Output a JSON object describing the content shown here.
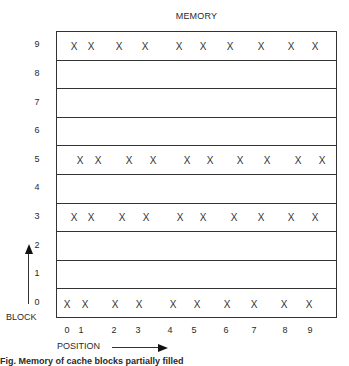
{
  "title": "MEMORY",
  "axis": {
    "block_label": "BLOCK",
    "position_label": "POSITION"
  },
  "caption": "Fig. Memory of cache blocks partially filled",
  "mark_symbol": "X",
  "blocks": [
    {
      "label": "9",
      "marks": [
        74,
        91,
        119,
        145,
        179,
        203,
        230,
        261,
        291,
        315
      ]
    },
    {
      "label": "8",
      "marks": []
    },
    {
      "label": "7",
      "marks": []
    },
    {
      "label": "6",
      "marks": []
    },
    {
      "label": "5",
      "marks": [
        80,
        98,
        129,
        153,
        187,
        210,
        240,
        267,
        298,
        322
      ]
    },
    {
      "label": "4",
      "marks": []
    },
    {
      "label": "3",
      "marks": [
        74,
        91,
        122,
        146,
        180,
        203,
        234,
        261,
        291,
        315
      ]
    },
    {
      "label": "2",
      "marks": []
    },
    {
      "label": "1",
      "marks": []
    },
    {
      "label": "0",
      "marks": [
        67,
        85,
        115,
        139,
        173,
        197,
        227,
        254,
        284,
        309
      ]
    }
  ],
  "positions": [
    {
      "label": "0",
      "x": 67
    },
    {
      "label": "1",
      "x": 81
    },
    {
      "label": "2",
      "x": 114
    },
    {
      "label": "3",
      "x": 138
    },
    {
      "label": "4",
      "x": 170
    },
    {
      "label": "5",
      "x": 194
    },
    {
      "label": "6",
      "x": 226
    },
    {
      "label": "7",
      "x": 254
    },
    {
      "label": "8",
      "x": 285
    },
    {
      "label": "9",
      "x": 310
    }
  ]
}
